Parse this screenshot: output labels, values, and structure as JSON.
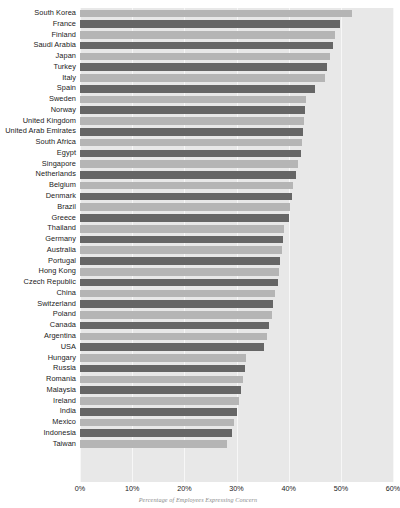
{
  "chart_data": {
    "type": "bar",
    "orientation": "horizontal",
    "title": "",
    "subtitle": "",
    "xlabel": "Percentage of Employees Expressing Concern",
    "ylabel": "",
    "xlim": [
      0,
      60
    ],
    "xtick_labels": [
      "0%",
      "10%",
      "20%",
      "30%",
      "40%",
      "50%",
      "60%"
    ],
    "xticks": [
      0,
      10,
      20,
      30,
      40,
      50,
      60
    ],
    "grid": true,
    "legend": "none",
    "categories": [
      "South Korea",
      "France",
      "Finland",
      "Saudi Arabia",
      "Japan",
      "Turkey",
      "Italy",
      "Spain",
      "Sweden",
      "Norway",
      "United Kingdom",
      "United Arab Emirates",
      "South Africa",
      "Egypt",
      "Singapore",
      "Netherlands",
      "Belgium",
      "Denmark",
      "Brazil",
      "Greece",
      "Thailand",
      "Germany",
      "Australia",
      "Portugal",
      "Hong Kong",
      "Czech Republic",
      "China",
      "Switzerland",
      "Poland",
      "Canada",
      "Argentina",
      "USA",
      "Hungary",
      "Russia",
      "Romania",
      "Malaysia",
      "Ireland",
      "India",
      "Mexico",
      "Indonesia",
      "Taiwan"
    ],
    "values": [
      52.2,
      49.8,
      48.9,
      48.5,
      48.0,
      47.4,
      46.9,
      45.0,
      43.4,
      43.2,
      42.9,
      42.7,
      42.5,
      42.3,
      41.8,
      41.4,
      40.9,
      40.7,
      40.2,
      40.0,
      39.2,
      39.0,
      38.8,
      38.4,
      38.2,
      38.0,
      37.4,
      37.0,
      36.8,
      36.3,
      35.8,
      35.2,
      31.9,
      31.6,
      31.2,
      30.9,
      30.5,
      30.0,
      29.6,
      29.2,
      28.2
    ],
    "bar_color_light": "#b5b5b5",
    "bar_color_dark": "#666666",
    "plot_background": "#e8e8e8",
    "gridline_color": "#f7f7f7"
  }
}
